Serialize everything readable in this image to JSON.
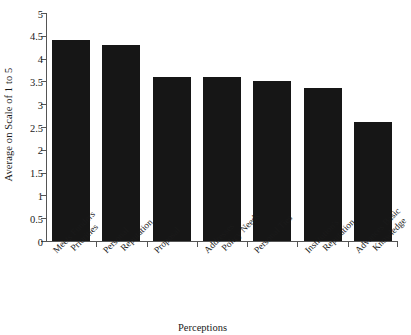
{
  "chart_data": {
    "type": "bar",
    "title": "",
    "xlabel": "Perceptions",
    "ylabel": "Average on Scale of 1 to 5",
    "categories": [
      "Meets Funders Priorities",
      "Personal Reputation",
      "Proposal",
      "Addresses Policy Needs",
      "Personal Ties",
      "Institution's Reputation",
      "Advances Basic Knowledge"
    ],
    "category_lines": [
      [
        "Meets Funders",
        "Priorities"
      ],
      [
        "Personal",
        "Reputation"
      ],
      [
        "Proposal",
        ""
      ],
      [
        "Addresses",
        "Policy Needs"
      ],
      [
        "Personal Ties",
        ""
      ],
      [
        "Institution's",
        "Reputation"
      ],
      [
        "Advances Basic",
        "Knowledge"
      ]
    ],
    "values": [
      4.4,
      4.3,
      3.6,
      3.6,
      3.5,
      3.35,
      2.6
    ],
    "ylim": [
      0,
      5
    ],
    "ytick_labels": [
      "0",
      "0.5",
      "1",
      "1.5",
      "2",
      "2.5",
      "3",
      "3.5",
      "4",
      "4.5",
      "5"
    ],
    "ytick_values": [
      0,
      0.5,
      1,
      1.5,
      2,
      2.5,
      3,
      3.5,
      4,
      4.5,
      5
    ],
    "grid": false,
    "legend": "none",
    "bar_color": "#161616",
    "axis_color": "#555555"
  }
}
